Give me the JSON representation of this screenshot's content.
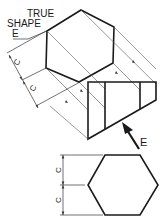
{
  "diagram": {
    "title_label": {
      "line1": "TRUE",
      "line2": "SHAPE",
      "line3": "E"
    },
    "view_direction_label": "E",
    "dimension_labels": {
      "top_upper": "C",
      "top_lower": "C",
      "bottom_upper": "C",
      "bottom_lower": "C"
    },
    "colors": {
      "line": "#1a1a1a",
      "projection": "#555555",
      "background": "#ffffff"
    }
  }
}
